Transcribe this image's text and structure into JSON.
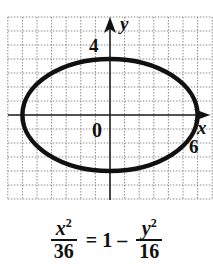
{
  "figure": {
    "type": "ellipse-graph",
    "axes": {
      "x_label": "x",
      "y_label": "y",
      "origin_label": "0",
      "x_tick_label": "6",
      "y_tick_label": "4"
    },
    "grid": {
      "x_units_left": 7,
      "x_units_right": 7,
      "y_units_above": 7,
      "y_units_below": 6,
      "style": "dotted",
      "color": "#8a8a8a"
    },
    "ellipse": {
      "center": [
        0,
        0
      ],
      "semi_major_x": 6,
      "semi_minor_y": 4,
      "stroke_color": "#111111"
    }
  },
  "equation": {
    "lhs_numerator": "x",
    "lhs_numerator_exp": "2",
    "lhs_denominator": "36",
    "equals": "=",
    "one": "1",
    "minus": "–",
    "rhs_numerator": "y",
    "rhs_numerator_exp": "2",
    "rhs_denominator": "16"
  }
}
